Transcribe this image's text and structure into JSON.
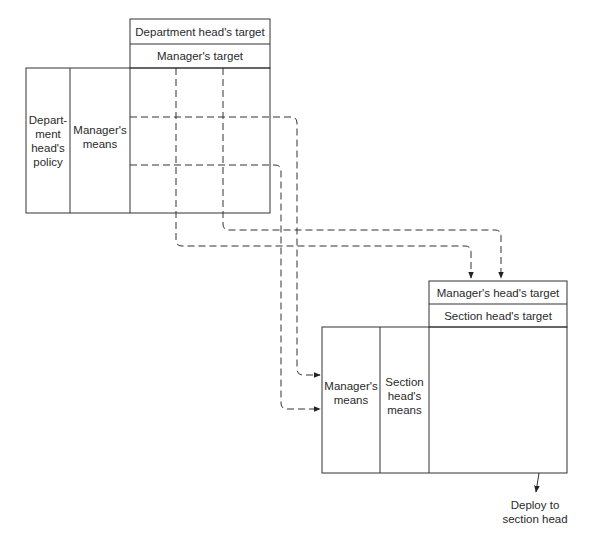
{
  "diagram": {
    "upper_table": {
      "header_rows": [
        "Department head's target",
        "Manager's target"
      ],
      "columns": [
        "Depart-\nment\nhead's\npolicy",
        "Manager's\nmeans"
      ],
      "grid": {
        "rows": 3,
        "cols": 3,
        "style": "dashed"
      }
    },
    "lower_table": {
      "header_rows": [
        "Manager's head's target",
        "Section head's target"
      ],
      "columns": [
        "Manager's\nmeans",
        "Section\nhead's\nmeans"
      ]
    },
    "connectors": [
      {
        "from": "upper grid row 2",
        "to": "lower Manager's means (upper arrow)",
        "style": "dashed"
      },
      {
        "from": "upper grid row 3",
        "to": "lower Manager's means (lower arrow)",
        "style": "dashed"
      },
      {
        "from": "upper grid col 1",
        "to": "Manager's head's target (left arrow)",
        "style": "dashed"
      },
      {
        "from": "upper grid col 2",
        "to": "Manager's head's target (right arrow)",
        "style": "dashed"
      }
    ],
    "footer_label": "Deploy to\nsection head",
    "colors": {
      "line": "#333333",
      "background": "#ffffff"
    }
  }
}
